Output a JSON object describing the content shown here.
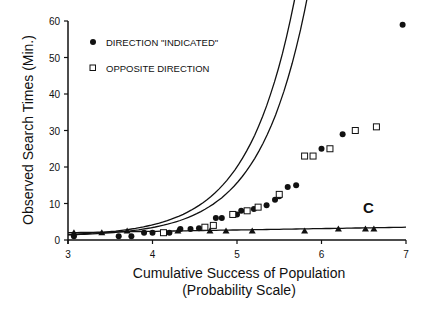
{
  "chart_data": {
    "type": "scatter",
    "title": "",
    "xlabel": "Cumulative Success of Population",
    "xlabel_sub": "(Probability Scale)",
    "ylabel": "Observed Search Times (Min.)",
    "xlim": [
      3,
      7
    ],
    "ylim": [
      0,
      60
    ],
    "x_ticks": [
      3,
      4,
      5,
      6,
      7
    ],
    "y_ticks": [
      0,
      10,
      20,
      30,
      40,
      50,
      60
    ],
    "grid": false,
    "legend_position": "top-left",
    "annotation": "C",
    "series": [
      {
        "name": "DIRECTION \"INDICATED\"",
        "marker": "filled-circle",
        "points": [
          [
            3.07,
            1.0
          ],
          [
            3.6,
            1.0
          ],
          [
            3.75,
            1.0
          ],
          [
            3.9,
            2.0
          ],
          [
            4.0,
            2.0
          ],
          [
            4.2,
            2.0
          ],
          [
            4.33,
            3.0
          ],
          [
            4.45,
            3.0
          ],
          [
            4.55,
            3.2
          ],
          [
            4.75,
            6.0
          ],
          [
            4.82,
            6.0
          ],
          [
            4.95,
            7.0
          ],
          [
            5.0,
            7.0
          ],
          [
            5.05,
            8.0
          ],
          [
            5.2,
            8.5
          ],
          [
            5.35,
            9.5
          ],
          [
            5.45,
            11.0
          ],
          [
            5.5,
            12.0
          ],
          [
            5.6,
            14.5
          ],
          [
            5.7,
            15.0
          ],
          [
            6.0,
            25.0
          ],
          [
            6.25,
            29.0
          ],
          [
            6.96,
            59.0
          ]
        ]
      },
      {
        "name": "OPPOSITE DIRECTION",
        "marker": "open-square",
        "points": [
          [
            4.13,
            2.0
          ],
          [
            4.62,
            3.5
          ],
          [
            4.72,
            4.0
          ],
          [
            4.95,
            7.0
          ],
          [
            5.12,
            8.0
          ],
          [
            5.25,
            9.0
          ],
          [
            5.5,
            12.5
          ],
          [
            5.8,
            23.0
          ],
          [
            5.9,
            23.0
          ],
          [
            6.1,
            25.0
          ],
          [
            6.4,
            30.0
          ],
          [
            6.65,
            31.0
          ]
        ]
      },
      {
        "name": "C",
        "marker": "filled-triangle",
        "points": [
          [
            3.07,
            2.0
          ],
          [
            3.4,
            2.0
          ],
          [
            3.7,
            2.5
          ],
          [
            4.3,
            2.5
          ],
          [
            4.68,
            2.5
          ],
          [
            4.87,
            2.5
          ],
          [
            5.18,
            2.5
          ],
          [
            5.8,
            2.5
          ],
          [
            6.2,
            3.0
          ],
          [
            6.52,
            3.0
          ],
          [
            6.62,
            3.0
          ]
        ]
      }
    ],
    "fit_lines": [
      {
        "name": "fit-indicated",
        "type": "exponential",
        "a": 0.52,
        "b": 1.8,
        "x0": 3.0,
        "x1": 6.76
      },
      {
        "name": "fit-opposite",
        "type": "exponential",
        "a": 0.4,
        "b": 1.8,
        "x0": 3.0,
        "x1": 6.93
      },
      {
        "name": "fit-c",
        "type": "linear",
        "y_at_x0": 2.0,
        "y_at_x1": 3.5,
        "x0": 3.0,
        "x1": 7.0
      }
    ]
  }
}
